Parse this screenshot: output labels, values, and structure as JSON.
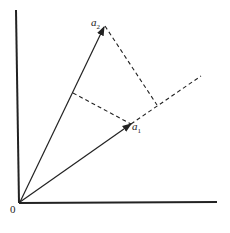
{
  "diagram": {
    "origin_label": "0",
    "vectors": [
      {
        "name": "a",
        "sub": "1"
      },
      {
        "name": "a",
        "sub": "2"
      }
    ],
    "colors": {
      "line": "#222222",
      "background": "#ffffff"
    }
  }
}
